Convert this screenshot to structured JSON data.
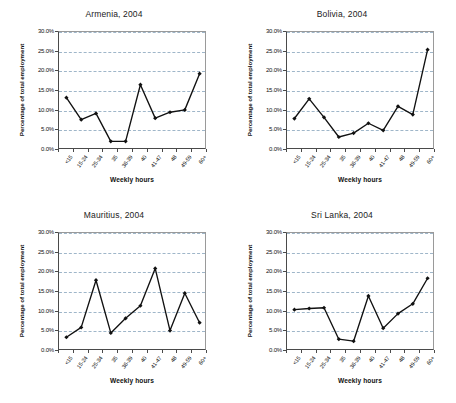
{
  "figure": {
    "axis": {
      "ylabel": "Percentage of total employment",
      "xlabel": "Weekly hours",
      "yticks": [
        "0.0%",
        "5.0%",
        "10.0%",
        "15.0%",
        "20.0%",
        "25.0%",
        "30.0%"
      ],
      "categories": [
        "<15",
        "15-24",
        "25-34",
        "35",
        "36-39",
        "40",
        "41-47",
        "48",
        "49-59",
        "60+"
      ]
    }
  },
  "chart_data": [
    {
      "type": "line",
      "title": "Armenia, 2004",
      "xlabel": "Weekly hours",
      "ylabel": "Percentage of total employment",
      "categories": [
        "<15",
        "15-24",
        "25-34",
        "35",
        "36-39",
        "40",
        "41-47",
        "48",
        "49-59",
        "60+"
      ],
      "values": [
        13.3,
        7.7,
        9.3,
        2.2,
        2.2,
        16.6,
        8.1,
        9.6,
        10.2,
        19.4
      ],
      "ylim": [
        0,
        30
      ],
      "ytick_step": 5,
      "grid": true,
      "legend": "none",
      "marker": "diamond",
      "color": "#111111"
    },
    {
      "type": "line",
      "title": "Bolivia, 2004",
      "xlabel": "Weekly hours",
      "ylabel": "Percentage of total employment",
      "categories": [
        "<15",
        "15-24",
        "25-34",
        "35",
        "36-39",
        "40",
        "41-47",
        "48",
        "49-59",
        "60+"
      ],
      "values": [
        8.0,
        13.0,
        8.3,
        3.3,
        4.3,
        6.8,
        5.0,
        11.1,
        9.0,
        25.5
      ],
      "ylim": [
        0,
        30
      ],
      "ytick_step": 5,
      "grid": true,
      "legend": "none",
      "marker": "diamond",
      "color": "#111111"
    },
    {
      "type": "line",
      "title": "Mauritius, 2004",
      "xlabel": "Weekly hours",
      "ylabel": "Percentage of total employment",
      "categories": [
        "<15",
        "15-24",
        "25-34",
        "35",
        "36-39",
        "40",
        "41-47",
        "48",
        "49-59",
        "60+"
      ],
      "values": [
        3.5,
        6.0,
        18.0,
        4.6,
        8.3,
        11.5,
        21.0,
        5.2,
        14.7,
        7.2
      ],
      "ylim": [
        0,
        30
      ],
      "ytick_step": 5,
      "grid": true,
      "legend": "none",
      "marker": "diamond",
      "color": "#111111"
    },
    {
      "type": "line",
      "title": "Sri Lanka, 2004",
      "xlabel": "Weekly hours",
      "ylabel": "Percentage of total employment",
      "categories": [
        "<15",
        "15-24",
        "25-34",
        "35",
        "36-39",
        "40",
        "41-47",
        "48",
        "49-59",
        "60+"
      ],
      "values": [
        10.5,
        10.8,
        11.0,
        3.0,
        2.5,
        14.0,
        5.8,
        9.5,
        12.0,
        18.5
      ],
      "ylim": [
        0,
        30
      ],
      "ytick_step": 5,
      "grid": true,
      "legend": "none",
      "marker": "diamond",
      "color": "#111111"
    }
  ]
}
